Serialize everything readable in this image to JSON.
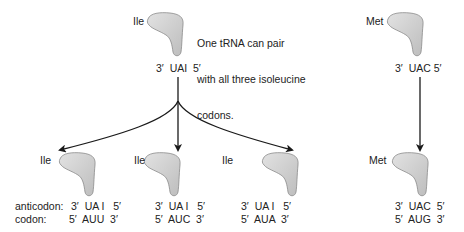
{
  "annotation": {
    "lines": [
      "One tRNA can pair",
      "with all three isoleucine",
      "codons."
    ]
  },
  "top": {
    "ile": {
      "amino_acid": "Ile",
      "anticodon": "3′  UAI  5′"
    },
    "met": {
      "amino_acid": "Met",
      "anticodon": "3′  UAC 5′"
    }
  },
  "row_labels": {
    "anticodon": "anticodon:",
    "codon": "codon:"
  },
  "bottom": [
    {
      "amino_acid": "Ile",
      "anticodon": "3′  UA I   5′",
      "codon": "5′  AUU  3′"
    },
    {
      "amino_acid": "Ile",
      "anticodon": "3′  UA I   5′",
      "codon": "5′  AUC  3′"
    },
    {
      "amino_acid": "Ile",
      "anticodon": "3′  UA I   5′",
      "codon": "5′  AUA  3′"
    },
    {
      "amino_acid": "Met",
      "anticodon": "3′  UAC  5′",
      "codon": "5′  AUG  3′"
    }
  ],
  "colors": {
    "trna_fill": "#cfcfcf",
    "trna_stroke": "#8a8a8a",
    "arrow": "#1a1a1a"
  }
}
